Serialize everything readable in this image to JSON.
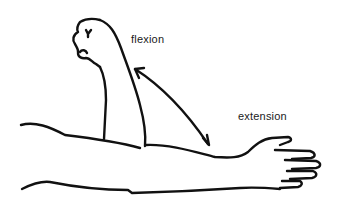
{
  "figure": {
    "labels": {
      "flexion": "flexion",
      "extension": "extension"
    },
    "arrow": "double-headed curved arrow between flexed and extended forearm",
    "colors": {
      "line": "#111111",
      "background": "#ffffff",
      "text": "#1a1a1a"
    }
  }
}
